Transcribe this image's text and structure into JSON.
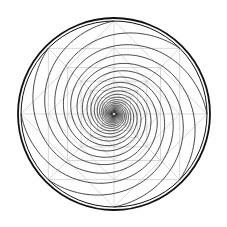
{
  "figure": {
    "width": 227,
    "height": 227,
    "background": "#ffffff",
    "center": [
      114,
      114
    ],
    "outer_ring": {
      "radius_outer": 96,
      "radius_inner": 93,
      "color": "#111111",
      "width_outer": 1.8,
      "width_inner": 1.0
    },
    "grid": {
      "color": "#c8c8c8",
      "width": 0.7,
      "levels": 7,
      "ratio": 0.7071
    },
    "spiral": {
      "color": "#333333",
      "width": 0.9,
      "arms": 8,
      "growth": 0.2,
      "turns": 1.1,
      "r_min": 1.5
    }
  }
}
